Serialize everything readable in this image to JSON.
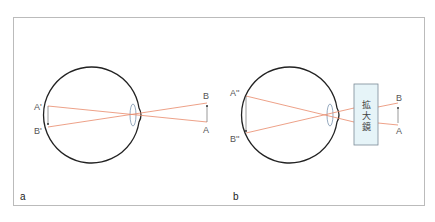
{
  "panels": [
    {
      "id": "a",
      "label": "a",
      "points": {
        "A_prime": "A'",
        "B_prime": "B'",
        "B": "B",
        "A": "A"
      }
    },
    {
      "id": "b",
      "label": "b",
      "points": {
        "A_double_prime": "A''",
        "B_double_prime": "B''",
        "B": "B",
        "A": "A"
      },
      "magnifier": {
        "chars": [
          "拡",
          "大",
          "鏡"
        ]
      }
    }
  ],
  "colors": {
    "ray": "#e8896a",
    "eye_outline": "#222222",
    "lens": "#8aa0b8",
    "frame": "#bbbbbb",
    "magnifier_fill": "#e6f4f8",
    "magnifier_stroke": "#7a8a96"
  }
}
